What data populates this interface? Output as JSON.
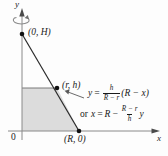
{
  "figure": {
    "type": "math-diagram",
    "background_color": "#fdfdfd",
    "shade_color": "#dcdcdc",
    "line_color": "#1a1a1a",
    "axes": {
      "x_label": "x",
      "y_label": "y",
      "origin_label": "0"
    },
    "points": [
      {
        "name": "point-0-H",
        "label": "(0, H)",
        "x": 22,
        "y": 34
      },
      {
        "name": "point-r-h",
        "label": "(r, h)",
        "x": 57,
        "y": 88
      },
      {
        "name": "point-R-0",
        "label": "(R, 0)",
        "x": 79,
        "y": 131
      }
    ],
    "equation_1": {
      "lhs": "y",
      "equals": "=",
      "frac_num": "h",
      "frac_den": "R − r",
      "rhs": "(R − x)"
    },
    "equation_2": {
      "prefix": "or",
      "lhs": "x",
      "equals": "=",
      "first_term": "R",
      "minus": "−",
      "frac_num": "R − r",
      "frac_den": "h",
      "trailing": "y"
    }
  }
}
